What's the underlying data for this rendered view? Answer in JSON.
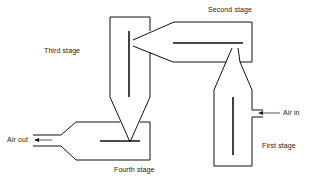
{
  "diagram": {
    "type": "four-stage cyclone separator schematic",
    "labels": {
      "first_stage": "First stage",
      "second_stage": "Second stage",
      "third_stage": "Third stage",
      "fourth_stage": "Fourth stage",
      "air_in": "Air in",
      "air_out": "Air out"
    },
    "colors": {
      "line": "#111111",
      "background": "#ffffff"
    }
  }
}
